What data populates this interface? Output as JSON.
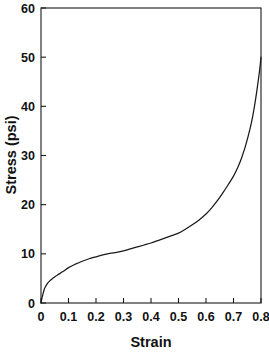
{
  "chart_data": {
    "type": "line",
    "title": "",
    "xlabel": "Strain",
    "ylabel": "Stress (psi)",
    "xlim": [
      0,
      0.8
    ],
    "ylim": [
      0,
      60
    ],
    "xticks": [
      "0",
      "0.1",
      "0.2",
      "0.3",
      "0.4",
      "0.5",
      "0.6",
      "0.7",
      "0.8"
    ],
    "xtick_values": [
      0,
      0.1,
      0.2,
      0.3,
      0.4,
      0.5,
      0.6,
      0.7,
      0.8
    ],
    "yticks": [
      "0",
      "10",
      "20",
      "30",
      "40",
      "50",
      "60"
    ],
    "ytick_values": [
      0,
      10,
      20,
      30,
      40,
      50,
      60
    ],
    "grid": false,
    "legend": false,
    "legend_position": "none",
    "line_color": "#1a1a1a",
    "series": [
      {
        "name": "stress-strain",
        "x": [
          0.0,
          0.004,
          0.008,
          0.012,
          0.016,
          0.02,
          0.025,
          0.03,
          0.04,
          0.05,
          0.06,
          0.08,
          0.1,
          0.125,
          0.15,
          0.175,
          0.2,
          0.225,
          0.25,
          0.275,
          0.3,
          0.325,
          0.35,
          0.375,
          0.4,
          0.425,
          0.45,
          0.475,
          0.5,
          0.525,
          0.55,
          0.575,
          0.6,
          0.62,
          0.64,
          0.66,
          0.68,
          0.7,
          0.715,
          0.73,
          0.745,
          0.76,
          0.77,
          0.78,
          0.79,
          0.795,
          0.8
        ],
        "y": [
          0.0,
          1.1,
          2.0,
          2.8,
          3.3,
          3.7,
          4.1,
          4.4,
          4.9,
          5.3,
          5.7,
          6.4,
          7.2,
          7.9,
          8.5,
          9.0,
          9.4,
          9.8,
          10.1,
          10.3,
          10.6,
          11.0,
          11.4,
          11.8,
          12.2,
          12.7,
          13.2,
          13.7,
          14.2,
          15.0,
          15.9,
          16.9,
          18.1,
          19.3,
          20.7,
          22.3,
          24.0,
          25.8,
          27.5,
          29.6,
          32.2,
          35.4,
          38.0,
          41.3,
          45.2,
          47.4,
          50.0
        ]
      }
    ]
  },
  "figure": {
    "background_color": "#ffffff",
    "axis_color": "#1a1a1a"
  }
}
